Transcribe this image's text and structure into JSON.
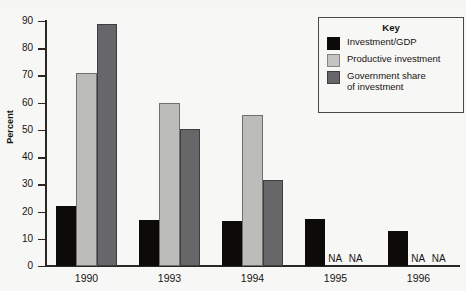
{
  "chart_data": {
    "type": "bar",
    "title": "",
    "xlabel": "",
    "ylabel": "Percent",
    "ylim": [
      0,
      90
    ],
    "ytick_step": 10,
    "yticks": [
      90,
      80,
      70,
      60,
      50,
      40,
      30,
      20,
      10,
      0
    ],
    "grid": false,
    "categories": [
      "1990",
      "1993",
      "1994",
      "1995",
      "1996"
    ],
    "legend_position": "top-right",
    "na_text": "NA",
    "series": [
      {
        "name": "Investment/GDP",
        "color": "#0d0b0a",
        "values": [
          22,
          17,
          16.5,
          17.2,
          13
        ]
      },
      {
        "name": "Productive investment",
        "color": "#bcbcbb",
        "values": [
          71,
          60,
          55.5,
          null,
          null
        ]
      },
      {
        "name": "Government share of investment",
        "color": "#67676a",
        "values": [
          89,
          50.5,
          31.5,
          null,
          null
        ]
      }
    ]
  },
  "legend": {
    "title": "Key",
    "items": [
      {
        "label": "Investment/GDP"
      },
      {
        "label": "Productive investment"
      },
      {
        "label": "Government share of investment"
      }
    ]
  }
}
